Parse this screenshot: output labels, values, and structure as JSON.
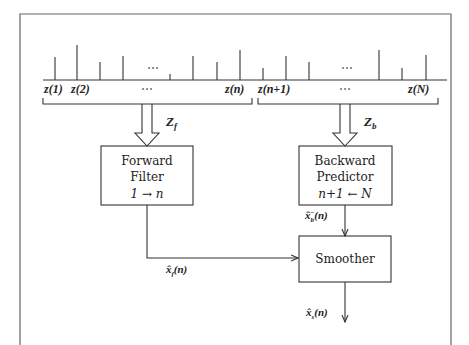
{
  "diagram": {
    "samples": {
      "labels": [
        "z(1)",
        "z(2)",
        "…",
        "z(n)",
        "z(n+1)",
        "…",
        "z(N)"
      ],
      "ellipsis": "⋯",
      "relative_heights": [
        0.23,
        0.35,
        0.18,
        0.24,
        0.06,
        0.24,
        0.18,
        0.3,
        0.12,
        0.24,
        0.18,
        0.3,
        0.12,
        0.25
      ]
    },
    "groups": {
      "forward": {
        "label": "Z",
        "subscript": "f"
      },
      "backward": {
        "label": "Z",
        "subscript": "b"
      }
    },
    "blocks": {
      "forward_filter": {
        "line1": "Forward",
        "line2": "Filter",
        "line3": "1 → n"
      },
      "backward_predictor": {
        "line1": "Backward",
        "line2": "Predictor",
        "line3": "n+1 ← N"
      },
      "smoother": {
        "label": "Smoother"
      }
    },
    "signals": {
      "xb": {
        "base": "x̂",
        "sub": "b",
        "sup": "−",
        "arg": "(n)"
      },
      "xf": {
        "base": "x̂",
        "sub": "f",
        "arg": "(n)"
      },
      "xs": {
        "base": "x̂",
        "sub": "s",
        "arg": "(n)"
      }
    }
  }
}
